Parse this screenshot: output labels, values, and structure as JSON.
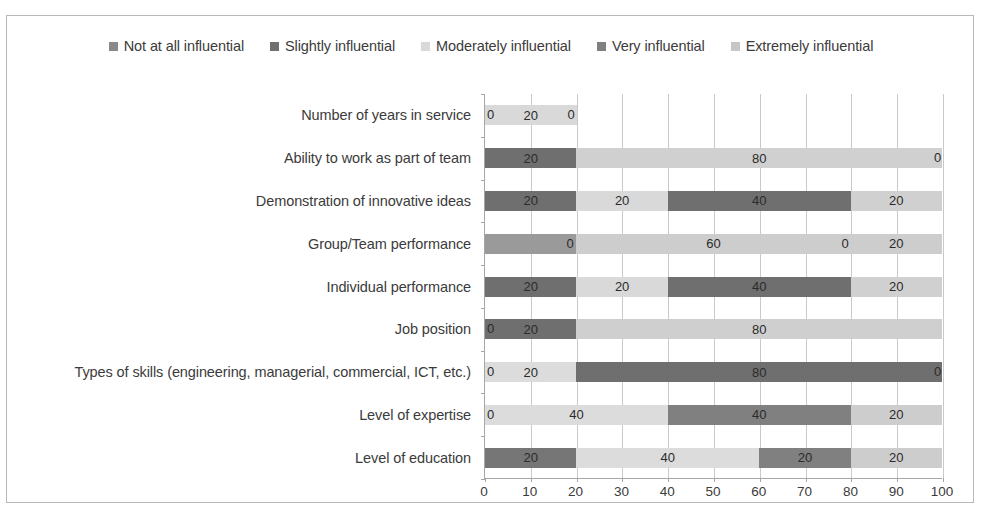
{
  "chart_data": {
    "type": "bar",
    "orientation": "horizontal",
    "stacked": true,
    "stack_mode": "percent",
    "title": "",
    "xlabel": "",
    "ylabel": "",
    "xlim": [
      0,
      100
    ],
    "xticks": [
      0,
      10,
      20,
      30,
      40,
      50,
      60,
      70,
      80,
      90,
      100
    ],
    "grid": true,
    "legend_position": "top",
    "legend": [
      {
        "label": "Not at all influential",
        "color": "#898989"
      },
      {
        "label": "Slightly influential",
        "color": "#6f6f6f"
      },
      {
        "label": "Moderately influential",
        "color": "#d9d9d9"
      },
      {
        "label": "Very influential",
        "color": "#808080"
      },
      {
        "label": "Extremely influential",
        "color": "#c6c6c6"
      }
    ],
    "categories": [
      "Number of years in service",
      "Ability to work as part of team",
      "Demonstration of innovative ideas",
      "Group/Team  performance",
      "Individual performance",
      "Job position",
      "Types of skills (engineering, managerial, commercial, ICT, etc.)",
      "Level of expertise",
      "Level of education"
    ],
    "series": [
      {
        "name": "Not at all influential",
        "values": [
          0,
          0,
          0,
          0,
          0,
          0,
          0,
          0,
          0
        ]
      },
      {
        "name": "Slightly influential",
        "values": [
          0,
          0,
          0,
          20,
          0,
          20,
          0,
          0,
          0
        ]
      },
      {
        "name": "Moderately influential",
        "values": [
          20,
          0,
          0,
          0,
          0,
          0,
          20,
          40,
          0
        ]
      },
      {
        "name": "Very influential",
        "values": [
          0,
          20,
          20,
          0,
          20,
          0,
          80,
          0,
          20
        ]
      },
      {
        "name": "Extremely influential",
        "values": [
          0,
          80,
          20,
          60,
          20,
          80,
          0,
          40,
          40
        ]
      }
    ],
    "rows": [
      {
        "category": "Number of years in service",
        "total": 20,
        "leading_zero": "0",
        "trailing_zero": "0",
        "segments": [
          {
            "series": "Moderately influential",
            "value": 20,
            "label": "20",
            "color": "#d9d9d9"
          }
        ]
      },
      {
        "category": "Ability to work as part of team",
        "total": 100,
        "leading_zero": "",
        "trailing_zero": "0",
        "segments": [
          {
            "series": "Very influential",
            "value": 20,
            "label": "20",
            "color": "#6f6f6f"
          },
          {
            "series": "Extremely influential",
            "value": 80,
            "label": "80",
            "color": "#d0d0d0"
          }
        ]
      },
      {
        "category": "Demonstration of innovative ideas",
        "total": 100,
        "leading_zero": "",
        "trailing_zero": "",
        "segments": [
          {
            "series": "Very influential",
            "value": 20,
            "label": "20",
            "color": "#6f6f6f"
          },
          {
            "series": "Moderately influential",
            "value": 20,
            "label": "20",
            "color": "#d9d9d9"
          },
          {
            "series": "Very influential",
            "value": 40,
            "label": "40",
            "color": "#6f6f6f"
          },
          {
            "series": "Extremely influential",
            "value": 20,
            "label": "20",
            "color": "#d0d0d0"
          }
        ]
      },
      {
        "category": "Group/Team  performance",
        "total": 100,
        "leading_zero": "",
        "trailing_zero": "",
        "segments": [
          {
            "series": "Slightly influential",
            "value": 20,
            "label": "",
            "color": "#9a9a9a"
          },
          {
            "series": "Extremely influential",
            "value": 60,
            "label": "60",
            "color": "#cdcdcd"
          },
          {
            "series": "Moderately influential",
            "value": 20,
            "label": "20",
            "color": "#cdcdcd"
          }
        ],
        "inner_zeros": [
          {
            "at": 20,
            "label": "0"
          },
          {
            "at": 80,
            "label": "0"
          }
        ]
      },
      {
        "category": "Individual performance",
        "total": 100,
        "leading_zero": "",
        "trailing_zero": "",
        "segments": [
          {
            "series": "Very influential",
            "value": 20,
            "label": "20",
            "color": "#6f6f6f"
          },
          {
            "series": "Moderately influential",
            "value": 20,
            "label": "20",
            "color": "#d9d9d9"
          },
          {
            "series": "Very influential",
            "value": 40,
            "label": "40",
            "color": "#6f6f6f"
          },
          {
            "series": "Extremely influential",
            "value": 20,
            "label": "20",
            "color": "#d0d0d0"
          }
        ]
      },
      {
        "category": "Job position",
        "total": 100,
        "leading_zero": "0",
        "trailing_zero": "",
        "segments": [
          {
            "series": "Slightly influential",
            "value": 20,
            "label": "20",
            "color": "#6f6f6f"
          },
          {
            "series": "Extremely influential",
            "value": 80,
            "label": "80",
            "color": "#cfcfcf"
          }
        ]
      },
      {
        "category": "Types of skills (engineering, managerial, commercial, ICT, etc.)",
        "total": 100,
        "leading_zero": "0",
        "trailing_zero": "0",
        "segments": [
          {
            "series": "Moderately influential",
            "value": 20,
            "label": "20",
            "color": "#dcdcdc"
          },
          {
            "series": "Very influential",
            "value": 80,
            "label": "80",
            "color": "#6f6f6f"
          }
        ]
      },
      {
        "category": "Level of expertise",
        "total": 100,
        "leading_zero": "0",
        "trailing_zero": "",
        "segments": [
          {
            "series": "Moderately influential",
            "value": 40,
            "label": "40",
            "color": "#dcdcdc"
          },
          {
            "series": "Very influential",
            "value": 40,
            "label": "40",
            "color": "#808080"
          },
          {
            "series": "Extremely influential",
            "value": 20,
            "label": "20",
            "color": "#cdcdcd"
          }
        ]
      },
      {
        "category": "Level of education",
        "total": 100,
        "leading_zero": "",
        "trailing_zero": "",
        "segments": [
          {
            "series": "Very influential",
            "value": 20,
            "label": "20",
            "color": "#767676"
          },
          {
            "series": "Moderately influential",
            "value": 40,
            "label": "40",
            "color": "#dcdcdc"
          },
          {
            "series": "Very influential",
            "value": 20,
            "label": "20",
            "color": "#808080"
          },
          {
            "series": "Extremely influential",
            "value": 20,
            "label": "20",
            "color": "#cdcdcd"
          }
        ]
      }
    ]
  }
}
